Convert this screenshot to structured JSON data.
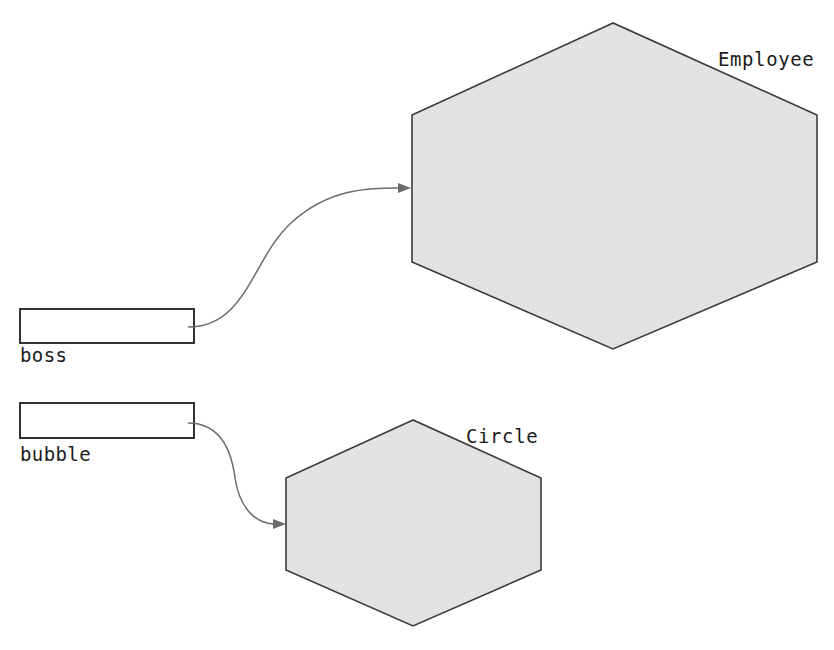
{
  "canvas": {
    "width": 834,
    "height": 650,
    "background": "#ffffff"
  },
  "style": {
    "node_fill": "#e3e3e3",
    "node_stroke": "#3a3a3a",
    "box_fill": "#ffffff",
    "box_stroke": "#1b1b1b",
    "edge_stroke": "#6b6b6b",
    "arrowhead_fill": "#6b6b6b",
    "text_color": "#1b1b1b"
  },
  "nodes": [
    {
      "id": "employee",
      "label": "Employee",
      "shape": "hexagon",
      "points": "613,23 412,115 412,262 613,349 817,262 817,115",
      "label_x": 718,
      "label_y": 66
    },
    {
      "id": "circle",
      "label": "Circle",
      "shape": "hexagon",
      "points": "413,420 286,478 286,570 413,626 541,570 541,478",
      "label_x": 466,
      "label_y": 443
    }
  ],
  "variables": [
    {
      "id": "boss",
      "label": "boss",
      "box": {
        "x": 20,
        "y": 309,
        "width": 174,
        "height": 34
      },
      "label_x": 20,
      "label_y": 362
    },
    {
      "id": "bubble",
      "label": "bubble",
      "box": {
        "x": 20,
        "y": 403,
        "width": 174,
        "height": 35
      },
      "label_x": 20,
      "label_y": 461
    }
  ],
  "edges": [
    {
      "id": "boss-to-employee",
      "from": "boss",
      "to": "employee",
      "path": "M 188 327 C 247 327 252 258 292 222 C 331 187 372 188 400 188",
      "arrow_tip_x": 411,
      "arrow_tip_y": 188,
      "arrow_points": "411,188 398,183 398,193"
    },
    {
      "id": "bubble-to-circle",
      "from": "bubble",
      "to": "circle",
      "path": "M 188 423 C 218 423 231 447 235 478 C 240 511 258 524 275 524",
      "arrow_tip_x": 286,
      "arrow_tip_y": 524,
      "arrow_points": "286,524 273,519 273,529"
    }
  ]
}
